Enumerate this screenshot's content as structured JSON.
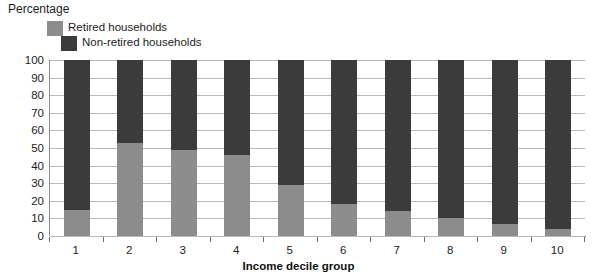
{
  "chart_data": {
    "type": "bar",
    "stacked": true,
    "title": "",
    "ylabel": "Percentage",
    "xlabel": "Income decile group",
    "categories": [
      "1",
      "2",
      "3",
      "4",
      "5",
      "6",
      "7",
      "8",
      "9",
      "10"
    ],
    "ylim": [
      0,
      100
    ],
    "yticks": [
      0,
      10,
      20,
      30,
      40,
      50,
      60,
      70,
      80,
      90,
      100
    ],
    "grid": true,
    "legend_position": "top-left",
    "series": [
      {
        "name": "Retired households",
        "color": "#8c8c8c",
        "values": [
          15,
          53,
          49,
          46,
          29,
          18,
          14,
          10,
          7,
          4
        ]
      },
      {
        "name": "Non-retired households",
        "color": "#3b3b3b",
        "values": [
          85,
          47,
          51,
          54,
          71,
          82,
          86,
          90,
          93,
          96
        ]
      }
    ]
  },
  "legend": {
    "items": [
      {
        "label": "Retired households",
        "swatch": "retired-swatch"
      },
      {
        "label": "Non-retired households",
        "swatch": "non-retired-swatch"
      }
    ]
  },
  "axes": {
    "y_title": "Percentage",
    "x_title": "Income decile group"
  }
}
